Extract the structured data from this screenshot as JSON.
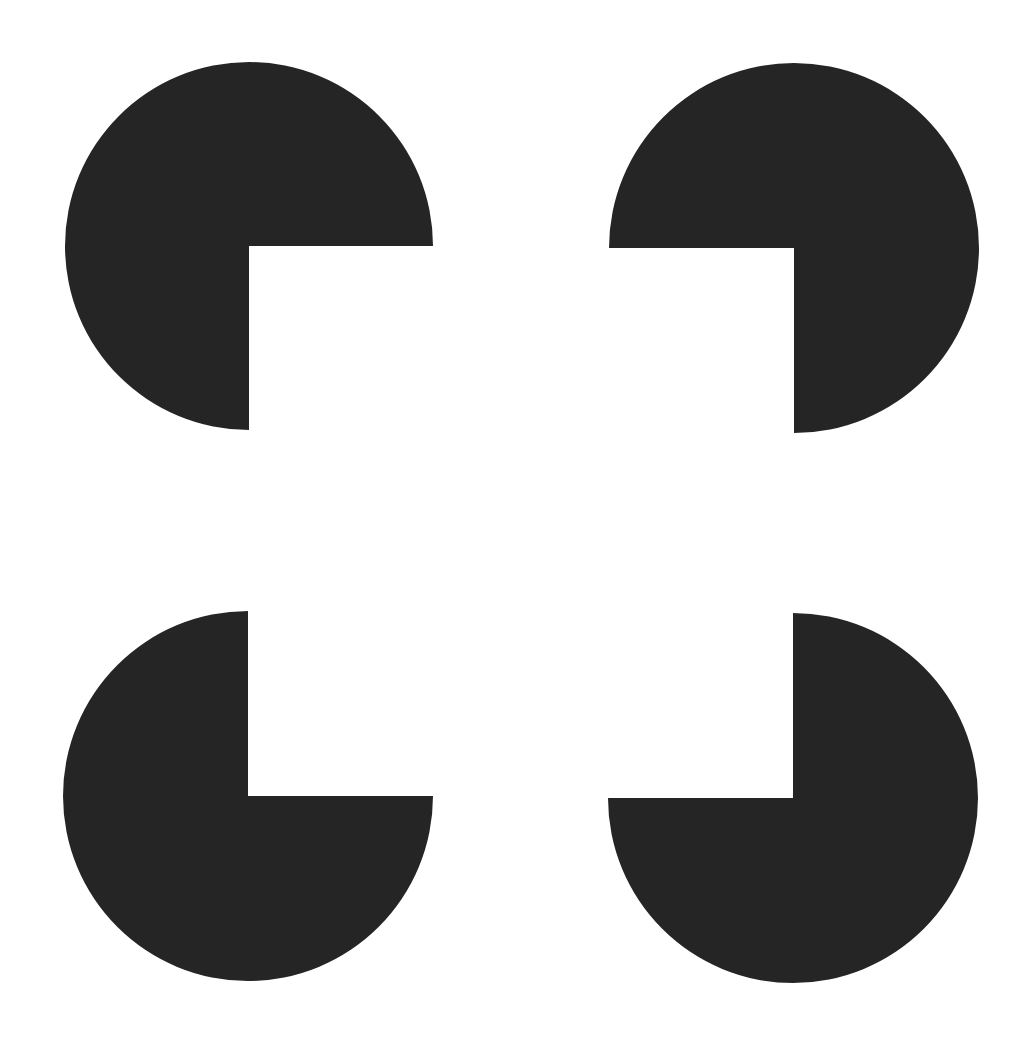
{
  "figure": {
    "background": "#ffffff",
    "fill_color": "#252525",
    "width": 1032,
    "height": 1040
  },
  "inducers": [
    {
      "name": "inducer-top-left",
      "cx": 249,
      "cy": 246,
      "r": 184,
      "notch": "bottom-right"
    },
    {
      "name": "inducer-top-right",
      "cx": 794,
      "cy": 248,
      "r": 185,
      "notch": "bottom-left"
    },
    {
      "name": "inducer-bottom-left",
      "cx": 248,
      "cy": 796,
      "r": 185,
      "notch": "top-right"
    },
    {
      "name": "inducer-bottom-right",
      "cx": 793,
      "cy": 798,
      "r": 185,
      "notch": "top-left"
    }
  ]
}
